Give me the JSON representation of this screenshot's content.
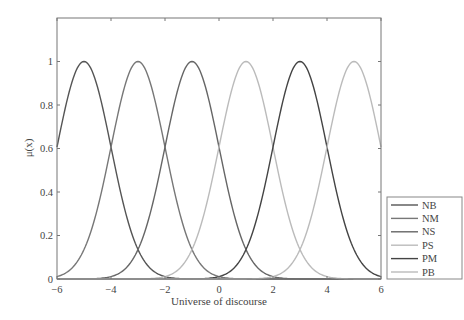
{
  "chart_data": {
    "type": "line",
    "title": "",
    "xlabel": "Universe of discourse",
    "ylabel": "μ(x)",
    "xlim": [
      -6,
      6
    ],
    "ylim": [
      0,
      1.2
    ],
    "xticks": [
      -6,
      -4,
      -2,
      0,
      2,
      4,
      6
    ],
    "xtick_labels": [
      "−6",
      "−4",
      "−2",
      "0",
      "2",
      "4",
      "6"
    ],
    "yticks": [
      0,
      0.2,
      0.4,
      0.6,
      0.8,
      1
    ],
    "ytick_labels": [
      "0",
      "0.2",
      "0.4",
      "0.6",
      "0.8",
      "1"
    ],
    "grid": false,
    "legend_position": "outside lower right",
    "function": "gaussian membership, sigma = 1",
    "series": [
      {
        "name": "NB",
        "center": -5,
        "sigma": 1,
        "color": "#555555"
      },
      {
        "name": "NM",
        "center": -3,
        "sigma": 1,
        "color": "#777777"
      },
      {
        "name": "NS",
        "center": -1,
        "sigma": 1,
        "color": "#666666"
      },
      {
        "name": "PS",
        "center": 1,
        "sigma": 1,
        "color": "#bbbbbb"
      },
      {
        "name": "PM",
        "center": 3,
        "sigma": 1,
        "color": "#444444"
      },
      {
        "name": "PB",
        "center": 5,
        "sigma": 1,
        "color": "#bbbbbb"
      }
    ]
  }
}
